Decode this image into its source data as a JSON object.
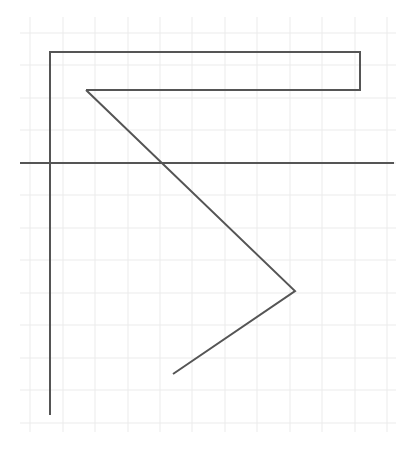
{
  "diagram": {
    "width": 418,
    "height": 451,
    "background": "#ffffff",
    "grid": {
      "color": "#ebebeb",
      "x_start": 20,
      "x_end": 396,
      "y_start": 17,
      "y_end": 432,
      "vertical_lines_x": [
        30,
        63,
        95,
        128,
        160,
        192,
        225,
        257,
        290,
        322,
        355,
        387
      ],
      "horizontal_lines_y": [
        33,
        65,
        98,
        130,
        163,
        195,
        228,
        260,
        293,
        325,
        358,
        390,
        423
      ]
    },
    "stroke_color": "#555555",
    "shapes": [
      {
        "name": "outer-frame-polyline",
        "points": [
          [
            50,
            415
          ],
          [
            50,
            52
          ],
          [
            360,
            52
          ],
          [
            360,
            90
          ],
          [
            86,
            90
          ]
        ]
      },
      {
        "name": "zigzag-polyline",
        "points": [
          [
            86,
            90
          ],
          [
            295,
            291
          ],
          [
            173,
            374
          ]
        ]
      },
      {
        "name": "horizontal-axis-line",
        "points": [
          [
            20,
            163
          ],
          [
            394,
            163
          ]
        ]
      }
    ]
  }
}
